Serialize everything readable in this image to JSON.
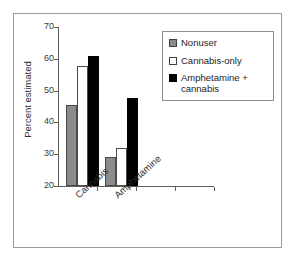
{
  "chart_data": {
    "type": "bar",
    "title": "",
    "subtitle": "",
    "xlabel": "",
    "ylabel": "Percent estimated",
    "categories": [
      "Cannabis",
      "Amphetamine"
    ],
    "ylim": [
      20,
      70
    ],
    "yticks": [
      20,
      30,
      40,
      50,
      60,
      70
    ],
    "ytick_labels": [
      "20",
      "30",
      "40",
      "50",
      "60",
      "70"
    ],
    "grid": false,
    "legend_position": "top-right",
    "series": [
      {
        "name": "Nonuser",
        "color": "#8b8b8b",
        "values": [
          45.6,
          29.2
        ]
      },
      {
        "name": "Cannabis-only",
        "color": "#ffffff",
        "values": [
          57.6,
          32.1
        ]
      },
      {
        "name": "Amphetamine + cannabis",
        "color": "#000000",
        "values": [
          60.8,
          47.8
        ]
      }
    ],
    "annotations": []
  },
  "legend": {
    "items": [
      {
        "label": "Nonuser",
        "swatch": "gray-swatch"
      },
      {
        "label": "Cannabis-only",
        "swatch": "white-swatch"
      },
      {
        "label": "Amphetamine + cannabis",
        "swatch": "black-swatch"
      }
    ]
  }
}
